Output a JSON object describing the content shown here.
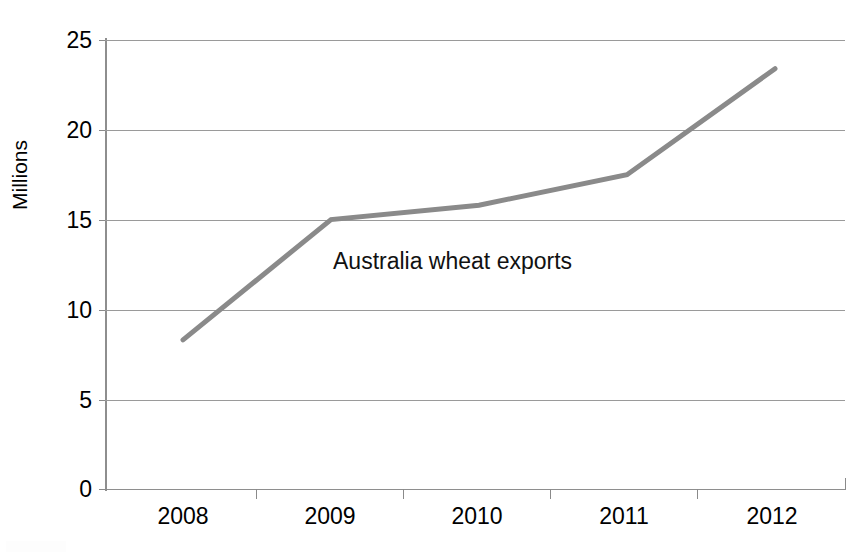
{
  "chart_data": {
    "type": "line",
    "title": "",
    "subtitle": "",
    "xlabel": "",
    "ylabel": "Millions",
    "categories": [
      "2008",
      "2009",
      "2010",
      "2011",
      "2012"
    ],
    "series": [
      {
        "name": "Australia wheat exports",
        "values": [
          8.3,
          15.0,
          15.8,
          17.5,
          23.4
        ],
        "color": "#8a8a8a"
      }
    ],
    "annotations": [
      {
        "text": "Australia wheat exports",
        "x": "2009",
        "y": 12.5
      }
    ],
    "ylim": [
      0,
      25
    ],
    "ytick_labels": [
      "25",
      "20",
      "15",
      "10",
      "5",
      "0"
    ],
    "ytick_values": [
      25,
      20,
      15,
      10,
      5,
      0
    ],
    "grid": "horizontal",
    "legend": "none",
    "gridline_color": "#9a9a9a",
    "axis_color": "#8e8e8e",
    "text_color": "#000000",
    "background": "#ffffff"
  }
}
